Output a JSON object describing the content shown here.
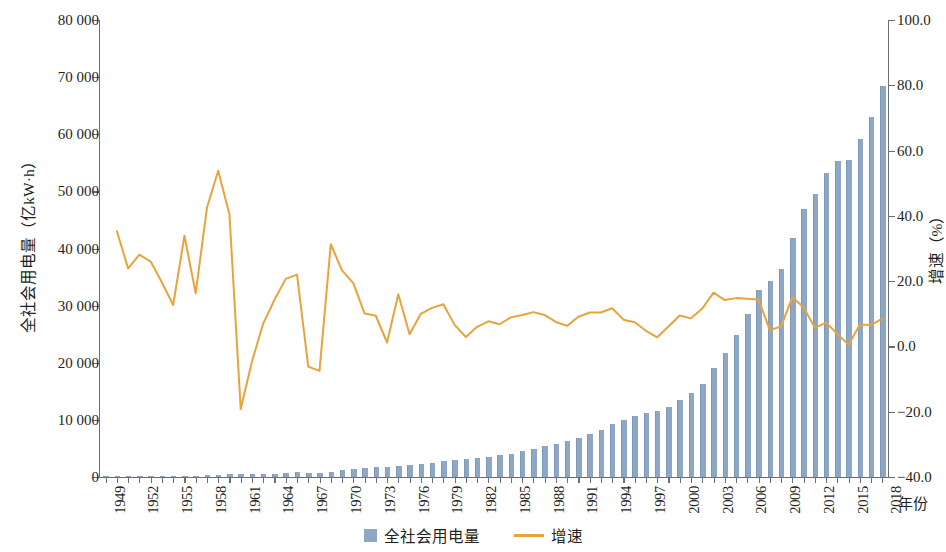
{
  "chart_data": {
    "type": "bar",
    "title": "",
    "xlabel": "年份",
    "ylabel": "全社会用电量（亿kW·h）",
    "y2label": "增速（%）",
    "ylim": [
      0,
      80000
    ],
    "y2lim": [
      -40.0,
      100.0
    ],
    "grid": false,
    "legend_position": "bottom-center",
    "colors": {
      "bar": "#8ea7c4",
      "line": "#e8a33d",
      "axis": "#6d6e71",
      "text": "#231f20"
    },
    "y_ticks": [
      "0",
      "10 000",
      "20 000",
      "30 000",
      "40 000",
      "50 000",
      "60 000",
      "70 000",
      "80 000"
    ],
    "y2_ticks": [
      "-40.0",
      "-20.0",
      "0.0",
      "20.0",
      "40.0",
      "60.0",
      "80.0",
      "100.0"
    ],
    "x_tick_labels": [
      "1949",
      "1952",
      "1955",
      "1958",
      "1961",
      "1964",
      "1967",
      "1970",
      "1973",
      "1976",
      "1979",
      "1982",
      "1985",
      "1988",
      "1991",
      "1994",
      "1997",
      "2000",
      "2003",
      "2006",
      "2009",
      "2012",
      "2015",
      "2018"
    ],
    "categories": [
      1949,
      1950,
      1951,
      1952,
      1953,
      1954,
      1955,
      1956,
      1957,
      1958,
      1959,
      1960,
      1961,
      1962,
      1963,
      1964,
      1965,
      1966,
      1967,
      1968,
      1969,
      1970,
      1971,
      1972,
      1973,
      1974,
      1975,
      1976,
      1977,
      1978,
      1979,
      1980,
      1981,
      1982,
      1983,
      1984,
      1985,
      1986,
      1987,
      1988,
      1989,
      1990,
      1991,
      1992,
      1993,
      1994,
      1995,
      1996,
      1997,
      1998,
      1999,
      2000,
      2001,
      2002,
      2003,
      2004,
      2005,
      2006,
      2007,
      2008,
      2009,
      2010,
      2011,
      2012,
      2013,
      2014,
      2015,
      2016,
      2017,
      2018
    ],
    "series": [
      {
        "name": "全社会用电量",
        "type": "bar",
        "axis": "left",
        "unit": "亿kW·h",
        "values": [
          34,
          46,
          57,
          73,
          92,
          110,
          124,
          166,
          193,
          275,
          423,
          594,
          480,
          458,
          490,
          560,
          676,
          825,
          774,
          716,
          940,
          1159,
          1384,
          1524,
          1668,
          1688,
          1958,
          2031,
          2234,
          2498,
          2820,
          3006,
          3093,
          3278,
          3530,
          3770,
          4107,
          4500,
          4973,
          5452,
          5861,
          6230,
          6800,
          7505,
          8288,
          9260,
          10023,
          10764,
          11284,
          11598,
          12305,
          13472,
          14633,
          16331,
          19032,
          21735,
          24940,
          28588,
          32712,
          34334,
          36430,
          41923,
          46928,
          49591,
          53223,
          55233,
          55500,
          59198,
          63077,
          68449
        ]
      },
      {
        "name": "增速",
        "type": "line",
        "axis": "right",
        "unit": "%",
        "values": [
          null,
          35.3,
          23.9,
          28.1,
          26.0,
          19.6,
          12.7,
          33.9,
          16.3,
          42.5,
          53.8,
          40.4,
          -19.2,
          -4.6,
          7.0,
          14.3,
          20.7,
          22.0,
          -6.2,
          -7.5,
          31.3,
          23.3,
          19.4,
          10.1,
          9.4,
          1.2,
          16.0,
          3.7,
          10.0,
          11.8,
          12.9,
          6.6,
          2.9,
          6.0,
          7.7,
          6.8,
          8.9,
          9.6,
          10.5,
          9.6,
          7.5,
          6.3,
          9.1,
          10.4,
          10.4,
          11.7,
          8.2,
          7.4,
          4.8,
          2.8,
          6.1,
          9.5,
          8.6,
          11.6,
          16.5,
          14.2,
          14.8,
          14.6,
          14.4,
          5.0,
          6.1,
          15.1,
          12.0,
          5.7,
          7.3,
          3.8,
          0.5,
          6.7,
          6.6,
          8.5
        ]
      }
    ]
  },
  "legend": {
    "bar_label": "全社会用电量",
    "line_label": "增速"
  }
}
